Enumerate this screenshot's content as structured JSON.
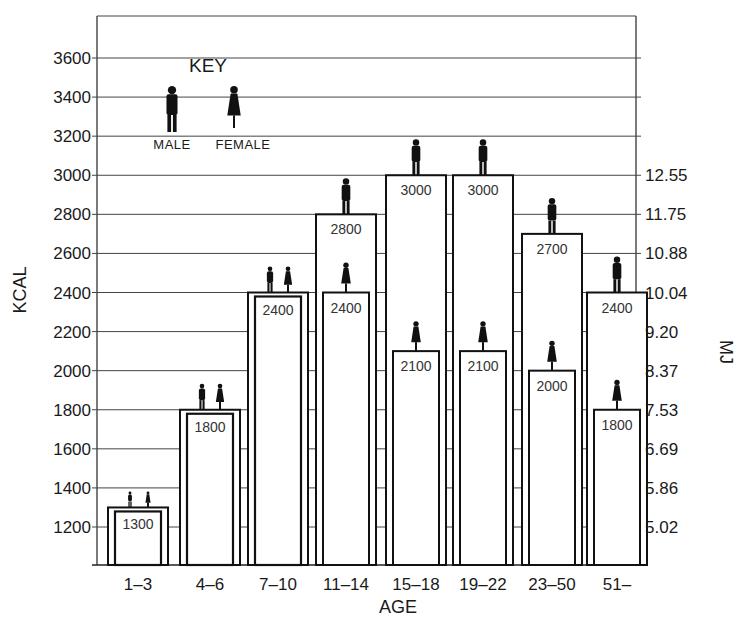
{
  "chart_data": {
    "type": "bar",
    "title": "",
    "xlabel": "AGE",
    "ylabel": "KCAL",
    "ylabel_right": "MJ",
    "categories": [
      "1-3",
      "4-6",
      "7-10",
      "11-14",
      "15-18",
      "19-22",
      "23-50",
      "51-"
    ],
    "series": [
      {
        "name": "MALE",
        "values": [
          1300,
          1800,
          2400,
          2800,
          3000,
          3000,
          2700,
          2400
        ]
      },
      {
        "name": "FEMALE",
        "values": [
          1300,
          1800,
          2400,
          2400,
          2100,
          2100,
          2000,
          1800
        ]
      }
    ],
    "ylim": [
      1000,
      3800
    ],
    "yticks_left": [
      1200,
      1400,
      1600,
      1800,
      2000,
      2200,
      2400,
      2600,
      2800,
      3000,
      3200,
      3400,
      3600
    ],
    "yticks_right": [
      {
        "kcal": 1200,
        "label": "5.02"
      },
      {
        "kcal": 1400,
        "label": "5.86"
      },
      {
        "kcal": 1600,
        "label": "6.69"
      },
      {
        "kcal": 1800,
        "label": "7.53"
      },
      {
        "kcal": 2000,
        "label": "8.37"
      },
      {
        "kcal": 2200,
        "label": "9.20"
      },
      {
        "kcal": 2400,
        "label": "10.04"
      },
      {
        "kcal": 2600,
        "label": "10.88"
      },
      {
        "kcal": 2800,
        "label": "11.75"
      },
      {
        "kcal": 3000,
        "label": "12.55"
      }
    ],
    "grid": true,
    "legend": {
      "title": "KEY",
      "entries": [
        "MALE",
        "FEMALE"
      ],
      "position": "top-left inside plot"
    }
  }
}
